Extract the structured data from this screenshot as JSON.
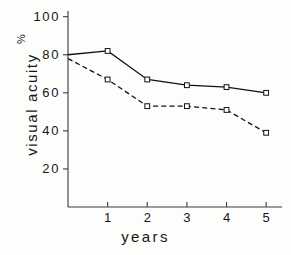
{
  "chart_data": {
    "type": "line",
    "title": "",
    "xlabel": "years",
    "ylabel": "visual acuity",
    "units": "%",
    "x": [
      0,
      1,
      2,
      3,
      4,
      5
    ],
    "xlim": [
      0,
      5.4
    ],
    "ylim": [
      0,
      103
    ],
    "xticks": [
      1,
      2,
      3,
      4,
      5
    ],
    "xtick_labels": [
      "1",
      "2",
      "3",
      "4",
      "5"
    ],
    "yticks": [
      20,
      40,
      60,
      80,
      100
    ],
    "ytick_labels": [
      "20",
      "40",
      "60",
      "80",
      "100"
    ],
    "grid": false,
    "legend": "none",
    "series": [
      {
        "name": "solid-series",
        "style": "solid",
        "marker": "open-square",
        "color": "#111111",
        "values": [
          80,
          82,
          67,
          64,
          63,
          60
        ]
      },
      {
        "name": "dashed-series",
        "style": "dashed",
        "marker": "open-square",
        "color": "#111111",
        "values": [
          78,
          67,
          53,
          53,
          51,
          39
        ]
      }
    ]
  },
  "axis": {
    "ylabel_text": "visual acuity",
    "percent_symbol": "%",
    "xlabel_text": "years"
  }
}
